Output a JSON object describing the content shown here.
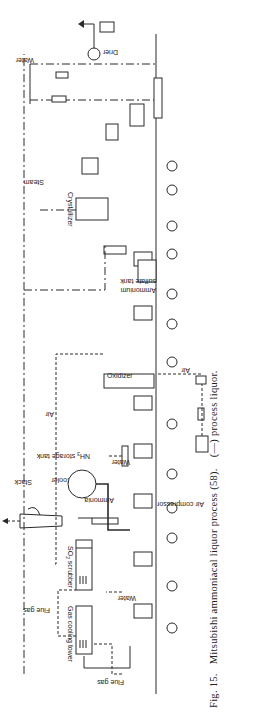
{
  "figure": {
    "caption_number": "Fig. 15.",
    "caption_title": "Mitsubishi ammoniacal liquor process (58).",
    "caption_legend": "(—) process liquor.",
    "orientation": "rotated 90° counter-clockwise"
  },
  "labels": {
    "flue_gas_in": "Flue gas",
    "flue_gas": "Flue gas",
    "gas_cooling_tower": "Gas cooling tower",
    "water_1": "Water",
    "so2_scrubber": "SO",
    "so2_sub": "2",
    "so2_rest": " scrubber",
    "stack": "Stack",
    "cooler": "Cooler",
    "air_1": "Air",
    "ammonia": "Ammonia",
    "nh3_storage": "NH",
    "nh3_sub": "3",
    "nh3_rest": " storage tank",
    "water_2": "Water",
    "air_compressor": "Air compressor",
    "air_2": "Air",
    "oxidizer": "Oxidizer",
    "ammonium_sulfate_tank_1": "Ammonium",
    "ammonium_sulfate_tank_2": "sulfate tank",
    "crystallizer": "Crystallizer",
    "steam": "Steam",
    "water_3": "Water",
    "drier": "Drier"
  },
  "colors": {
    "ink": "#2a2a2a",
    "paper": "#ffffff"
  }
}
